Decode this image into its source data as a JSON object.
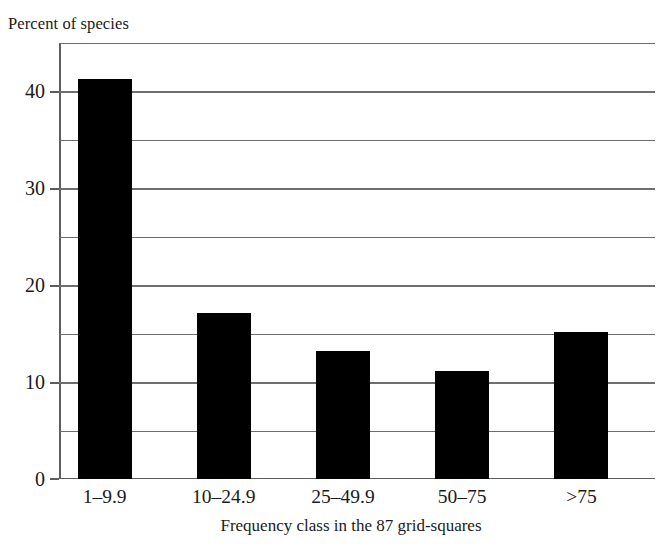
{
  "chart_data": {
    "type": "bar",
    "title": "",
    "subtitle": "",
    "xlabel": "Frequency class in the 87 grid-squares",
    "ylabel": "Percent of species",
    "categories": [
      "1–9.9",
      "10–24.9",
      "25–49.9",
      "50–75",
      ">75"
    ],
    "values": [
      41.3,
      17.1,
      13.2,
      11.2,
      15.2
    ],
    "ylim": [
      0,
      45
    ],
    "ytick_labels": [
      "0",
      "10",
      "20",
      "30",
      "40"
    ],
    "ytick_values": [
      0,
      10,
      20,
      30,
      40
    ],
    "gridlines": [
      0,
      5,
      10,
      15,
      20,
      25,
      30,
      35,
      40,
      45
    ],
    "grid": true,
    "grid_axis": "y",
    "legend": false,
    "legend_position": "none",
    "bar_color": "#000000",
    "grid_color": "#6e6e6e",
    "axis_color": "#5d5d5d",
    "background_color": "#ffffff",
    "text_color": "#1a1a1a"
  }
}
